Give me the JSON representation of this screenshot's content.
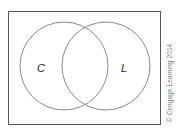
{
  "diagram": {
    "type": "venn",
    "universe": {
      "x": 8,
      "y": 11,
      "width": 152,
      "height": 113,
      "stroke": "#555555"
    },
    "sets": [
      {
        "label": "C",
        "cx": 64,
        "cy": 66,
        "r": 44,
        "label_x": 41,
        "label_y": 72,
        "stroke": "#888888"
      },
      {
        "label": "L",
        "cx": 106,
        "cy": 66,
        "r": 44,
        "label_x": 124,
        "label_y": 72,
        "stroke": "#888888"
      }
    ]
  },
  "credit": "© Cengage Learning 2014"
}
